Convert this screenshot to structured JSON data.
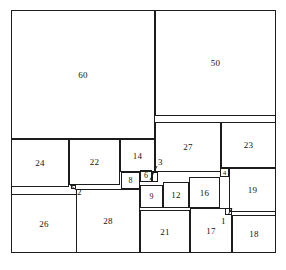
{
  "figure": {
    "type": "squared-square-diagram",
    "outer_square_side_units": 112,
    "square_count": 21,
    "line_color": "#1c1c1c",
    "background_color": "#ffffff",
    "label_color": "#141414"
  },
  "squares": [
    {
      "id": "sq-60",
      "label": "60",
      "size": 50,
      "x": 0,
      "y": 0,
      "w": 144,
      "h": 129,
      "label_style": "inside"
    },
    {
      "id": "sq-50",
      "label": "50",
      "size": 35,
      "x": 144,
      "y": 0,
      "w": 121,
      "h": 106,
      "label_style": "inside"
    },
    {
      "id": "sq-27",
      "label": "27",
      "size": 27,
      "x": 144,
      "y": 112,
      "w": 66,
      "h": 50,
      "label_style": "inside"
    },
    {
      "id": "sq-23",
      "label": "23",
      "size": 23,
      "x": 210,
      "y": 112,
      "w": 55,
      "h": 46,
      "label_style": "inside"
    },
    {
      "id": "sq-24",
      "label": "24",
      "size": 24,
      "x": 0,
      "y": 129,
      "w": 58,
      "h": 48,
      "label_style": "inside"
    },
    {
      "id": "sq-22",
      "label": "22",
      "size": 22,
      "x": 58,
      "y": 129,
      "w": 51,
      "h": 46,
      "label_style": "inside"
    },
    {
      "id": "sq-14",
      "label": "14",
      "size": 14,
      "x": 109,
      "y": 129,
      "w": 35,
      "h": 33,
      "label_style": "inside"
    },
    {
      "id": "sq-8",
      "label": "8",
      "size": 8,
      "x": 110,
      "y": 162,
      "w": 19,
      "h": 17,
      "label_style": "inside"
    },
    {
      "id": "sq-6",
      "label": "6",
      "size": 6,
      "x": 129,
      "y": 160,
      "w": 12,
      "h": 12,
      "label_style": "inside"
    },
    {
      "id": "sq-3",
      "label": "3",
      "size": 3,
      "x": 141,
      "y": 162,
      "w": 6,
      "h": 10,
      "label_style": "leader"
    },
    {
      "id": "sq-9",
      "label": "9",
      "size": 9,
      "x": 129,
      "y": 175,
      "w": 23,
      "h": 23,
      "label_style": "inside"
    },
    {
      "id": "sq-12",
      "label": "12",
      "size": 12,
      "x": 152,
      "y": 172,
      "w": 26,
      "h": 26,
      "label_style": "inside"
    },
    {
      "id": "sq-16",
      "label": "16",
      "size": 16,
      "x": 178,
      "y": 167,
      "w": 31,
      "h": 31,
      "label_style": "inside"
    },
    {
      "id": "sq-4",
      "label": "4",
      "size": 4,
      "x": 209,
      "y": 158,
      "w": 9,
      "h": 9,
      "label_style": "inside"
    },
    {
      "id": "sq-19",
      "label": "19",
      "size": 19,
      "x": 218,
      "y": 158,
      "w": 47,
      "h": 44,
      "label_style": "inside"
    },
    {
      "id": "sq-2",
      "label": "2",
      "size": 2,
      "x": 60,
      "y": 175,
      "w": 5,
      "h": 4,
      "label_style": "leader"
    },
    {
      "id": "sq-26",
      "label": "26",
      "size": 26,
      "x": 0,
      "y": 184,
      "w": 66,
      "h": 59,
      "label_style": "inside"
    },
    {
      "id": "sq-28",
      "label": "28",
      "size": 28,
      "x": 65,
      "y": 179,
      "w": 64,
      "h": 64,
      "label_style": "inside"
    },
    {
      "id": "sq-21",
      "label": "21",
      "size": 21,
      "x": 129,
      "y": 200,
      "w": 50,
      "h": 43,
      "label_style": "inside"
    },
    {
      "id": "sq-17",
      "label": "17",
      "size": 17,
      "x": 179,
      "y": 198,
      "w": 42,
      "h": 45,
      "label_style": "inside"
    },
    {
      "id": "sq-1",
      "label": "1",
      "size": 1,
      "x": 214,
      "y": 198,
      "w": 7,
      "h": 7,
      "label_style": "leader"
    },
    {
      "id": "sq-18",
      "label": "18",
      "size": 18,
      "x": 221,
      "y": 205,
      "w": 44,
      "h": 38,
      "label_style": "inside"
    }
  ],
  "leader_labels": [
    {
      "id": "leader-3",
      "label": "3",
      "label_x": 147,
      "label_y": 148,
      "line_x1": 146,
      "line_y1": 156,
      "line_x2": 139,
      "line_y2": 170
    },
    {
      "id": "leader-2",
      "label": "2",
      "label_x": 66,
      "label_y": 178,
      "line_x1": 65,
      "line_y1": 180,
      "line_x2": 58,
      "line_y2": 174
    },
    {
      "id": "leader-1",
      "label": "1",
      "label_x": 210,
      "label_y": 207,
      "line_x1": 217,
      "line_y1": 205,
      "line_x2": 221,
      "line_y2": 198
    }
  ]
}
